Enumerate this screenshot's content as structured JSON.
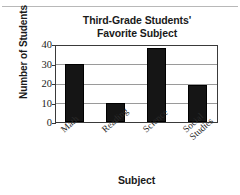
{
  "chart_data": {
    "type": "bar",
    "title": "Third-Grade Students' Favorite Subject",
    "title_line1": "Third-Grade Students'",
    "title_line2": "Favorite Subject",
    "xlabel": "Subject",
    "ylabel": "Number of Students",
    "categories": [
      "Math",
      "Reading",
      "Science",
      "Social Studies"
    ],
    "category_lines": [
      [
        "Math"
      ],
      [
        "Reading"
      ],
      [
        "Science"
      ],
      [
        "Social",
        "Studies"
      ]
    ],
    "values": [
      30,
      10,
      38,
      19
    ],
    "ylim": [
      0,
      40
    ],
    "yticks": [
      40,
      30,
      20,
      10,
      0
    ],
    "ytick_labels": [
      "40",
      "30",
      "20",
      "10",
      "0"
    ],
    "grid": true,
    "grid_axis": "y",
    "legend": null,
    "bar_color": "#151515",
    "frame_color": "#3a3a3a",
    "grid_color": "#9a9a9a"
  }
}
